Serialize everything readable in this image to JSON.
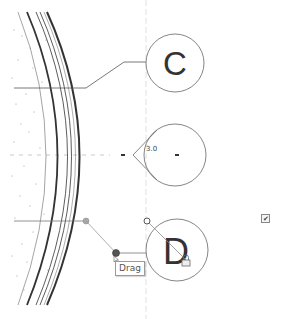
{
  "view": {
    "type": "cad-plan-view",
    "background": "#ffffff",
    "line_color": "#333333",
    "grid_line_color": "#cccccc"
  },
  "grid_tags": [
    {
      "id": "C",
      "label": "C",
      "cx": 175,
      "cy": 63,
      "r": 29
    },
    {
      "id": "unnamed",
      "label": "",
      "cx": 175,
      "cy": 155,
      "r": 31
    },
    {
      "id": "D",
      "label": "D",
      "cx": 177,
      "cy": 250,
      "r": 31
    }
  ],
  "dimension": {
    "angle_label": "3.0"
  },
  "tooltip": {
    "label": "Drag"
  },
  "checkbox": {
    "glyph": "✔",
    "checked": true
  },
  "icons": {
    "lock": "lock-icon",
    "drag_handle": "drag-handle-icon",
    "cursor": "cursor-icon"
  }
}
